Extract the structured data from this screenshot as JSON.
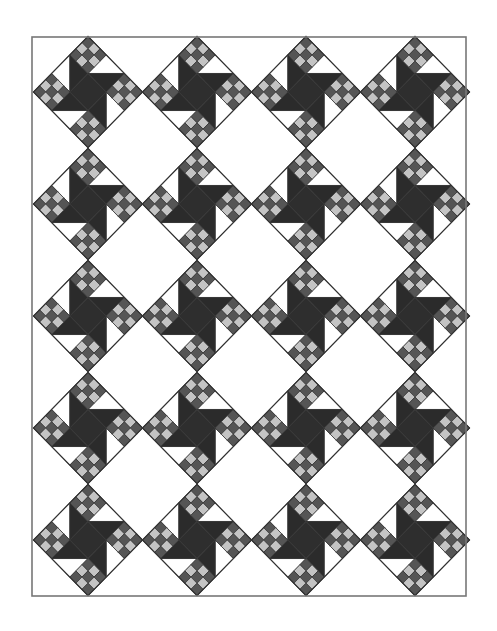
{
  "quilt": {
    "border": {
      "x": 32,
      "y": 37,
      "width": 434,
      "height": 559,
      "stroke": "#777777"
    },
    "columns": [
      88,
      197,
      306,
      415
    ],
    "rows": [
      92,
      204,
      316,
      428,
      540
    ],
    "block_half_diagonal": 54.5,
    "vertical_scale": 1.02,
    "grid": {
      "cols": 4,
      "rows": 5,
      "block_count": 20
    },
    "block": {
      "name": "pinwheel-ninepatch-block",
      "center_unit": "dark-square",
      "corner_units": "nine-patch",
      "edge_units": "half-square-triangle-pinwheel"
    },
    "colors": {
      "background": "#ffffff",
      "blade_dark": "#2b2b2b",
      "center_dark": "#2e2e2e",
      "patch_dark": "#555555",
      "patch_light": "#c4c4c4",
      "white": "#ffffff",
      "line": "#333333"
    }
  }
}
